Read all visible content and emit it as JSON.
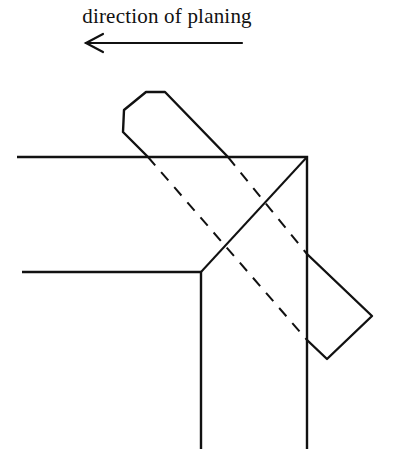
{
  "caption": {
    "text": "direction of planing"
  },
  "arrow": {
    "direction": "left",
    "icon": "left-arrow-icon"
  },
  "colors": {
    "line": "#111111",
    "background": "#ffffff"
  },
  "diagram": {
    "elements": [
      "outer-frame-edge",
      "inner-frame-edge",
      "miter-joint-line",
      "plane-outline",
      "plane-sole-hidden-lines"
    ]
  }
}
